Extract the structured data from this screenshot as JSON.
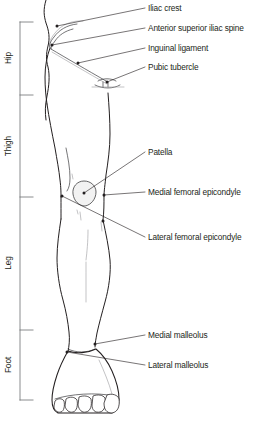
{
  "figure": {
    "width": 261,
    "height": 423,
    "background_color": "#ffffff",
    "line_color": "#231f20",
    "bracket_color": "#6d6e71",
    "patella_fill": "#f2f2f2"
  },
  "regions": [
    {
      "label": "Hip",
      "y_top": 22,
      "y_bottom": 95
    },
    {
      "label": "Thigh",
      "y_top": 95,
      "y_bottom": 197
    },
    {
      "label": "Leg",
      "y_top": 197,
      "y_bottom": 330
    },
    {
      "label": "Foot",
      "y_top": 330,
      "y_bottom": 400
    }
  ],
  "labels": [
    {
      "text": "Iliac crest",
      "x": 148,
      "y": 11,
      "point_x": 57,
      "point_y": 26
    },
    {
      "text": "Anterior superior iliac spine",
      "x": 148,
      "y": 31,
      "point_x": 52,
      "point_y": 45
    },
    {
      "text": "Inguinal ligament",
      "x": 148,
      "y": 51,
      "point_x": 78,
      "point_y": 63
    },
    {
      "text": "Pubic tubercle",
      "x": 148,
      "y": 70,
      "point_x": 107,
      "point_y": 82
    },
    {
      "text": "Patella",
      "x": 148,
      "y": 155,
      "point_x": 84,
      "point_y": 193
    },
    {
      "text": "Medial femoral epicondyle",
      "x": 148,
      "y": 195,
      "point_x": 104,
      "point_y": 195
    },
    {
      "text": "Lateral femoral epicondyle",
      "x": 148,
      "y": 240,
      "point_x": 62,
      "point_y": 196
    },
    {
      "text": "Medial malleolus",
      "x": 148,
      "y": 338,
      "point_x": 95,
      "point_y": 344
    },
    {
      "text": "Lateral malleolus",
      "x": 148,
      "y": 368,
      "point_x": 67,
      "point_y": 352
    }
  ]
}
